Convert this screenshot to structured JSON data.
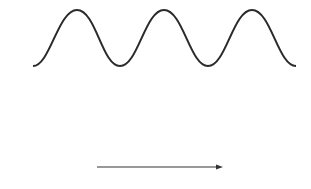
{
  "figure": {
    "panels": [
      {
        "label": "A",
        "description": "low-frequency sinusoidal wave",
        "cycles": 3
      },
      {
        "label": "B",
        "description": "high-frequency wave",
        "cycles": 10
      }
    ],
    "axis": {
      "label": "Time",
      "direction": "right-arrow"
    },
    "colors": {
      "line": "#2a2a2a",
      "text": "#333333",
      "background": "#ffffff"
    }
  }
}
